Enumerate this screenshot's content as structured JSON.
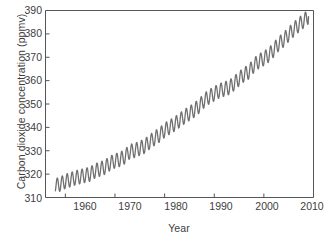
{
  "chart_data": {
    "type": "line",
    "title": "",
    "xlabel": "Year",
    "ylabel": "Carbon dioxide concentration (ppmv)",
    "xlim": [
      1956,
      2010
    ],
    "ylim": [
      310,
      390
    ],
    "xticks": [
      1960,
      1970,
      1980,
      1990,
      2000,
      2010
    ],
    "yticks": [
      310,
      320,
      330,
      340,
      350,
      360,
      370,
      380,
      390
    ],
    "xtick_labels": [
      "1960",
      "1970",
      "1980",
      "1990",
      "2000",
      "2010"
    ],
    "ytick_labels": [
      "310",
      "320",
      "330",
      "340",
      "350",
      "360",
      "370",
      "380",
      "390"
    ],
    "grid": false,
    "legend": "none",
    "series": [
      {
        "name": "Atmospheric CO2 (Mauna Loa monthly mean)",
        "color": "#707070",
        "seasonal_amplitude_ppmv": 3.1,
        "x": [
          1958.0,
          1959.0,
          1960.0,
          1961.0,
          1962.0,
          1963.0,
          1964.0,
          1965.0,
          1966.0,
          1967.0,
          1968.0,
          1969.0,
          1970.0,
          1971.0,
          1972.0,
          1973.0,
          1974.0,
          1975.0,
          1976.0,
          1977.0,
          1978.0,
          1979.0,
          1980.0,
          1981.0,
          1982.0,
          1983.0,
          1984.0,
          1985.0,
          1986.0,
          1987.0,
          1988.0,
          1989.0,
          1990.0,
          1991.0,
          1992.0,
          1993.0,
          1994.0,
          1995.0,
          1996.0,
          1997.0,
          1998.0,
          1999.0,
          2000.0,
          2001.0,
          2002.0,
          2003.0,
          2004.0,
          2005.0,
          2006.0,
          2007.0,
          2008.0,
          2009.0
        ],
        "y": [
          315.0,
          315.8,
          316.9,
          317.6,
          318.4,
          318.9,
          319.5,
          320.0,
          321.4,
          322.2,
          323.0,
          324.6,
          325.7,
          326.3,
          327.5,
          329.7,
          330.2,
          331.1,
          332.0,
          333.8,
          335.4,
          336.8,
          338.8,
          340.1,
          341.4,
          343.0,
          344.6,
          346.0,
          347.4,
          349.2,
          351.6,
          353.1,
          354.4,
          355.6,
          356.4,
          357.1,
          358.8,
          360.8,
          362.6,
          363.8,
          366.6,
          368.3,
          369.5,
          371.0,
          373.2,
          375.8,
          377.5,
          379.8,
          381.9,
          383.8,
          385.6,
          387.4
        ]
      }
    ]
  },
  "axes": {
    "frame_color": "#555555",
    "background": "#ffffff",
    "tick_direction": "in"
  }
}
